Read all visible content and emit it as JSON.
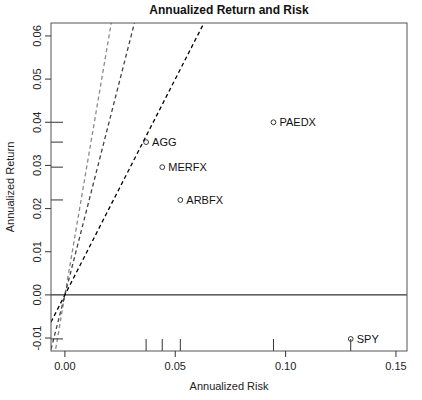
{
  "chart_data": {
    "type": "scatter",
    "title": "Annualized Return and Risk",
    "xlabel": "Annualized Risk",
    "ylabel": "Annualized Return",
    "xlim": [
      -0.0063,
      0.155
    ],
    "ylim": [
      -0.013,
      0.063
    ],
    "x_ticks": [
      0.0,
      0.05,
      0.1,
      0.15
    ],
    "x_tick_labels": [
      "0.00",
      "0.05",
      "0.10",
      "0.15"
    ],
    "y_ticks": [
      -0.01,
      0.0,
      0.01,
      0.02,
      0.03,
      0.04,
      0.05,
      0.06
    ],
    "y_tick_labels": [
      "-0.01",
      "0.00",
      "0.01",
      "0.02",
      "0.03",
      "0.04",
      "0.05",
      "0.06"
    ],
    "grid": false,
    "legend": null,
    "points": [
      {
        "label": "PAEDX",
        "risk": 0.0945,
        "return": 0.04
      },
      {
        "label": "AGG",
        "risk": 0.0368,
        "return": 0.0354
      },
      {
        "label": "MERFX",
        "risk": 0.0441,
        "return": 0.0296
      },
      {
        "label": "ARBFX",
        "risk": 0.0523,
        "return": 0.022
      },
      {
        "label": "SPY",
        "risk": 0.1295,
        "return": -0.0102
      }
    ],
    "reference_lines": [
      {
        "type": "horizontal",
        "y": 0.0,
        "style": "solid",
        "color": "#000000"
      },
      {
        "type": "ray_through_origin",
        "slope": 3.0,
        "style": "dashed",
        "color": "#8a8a8a"
      },
      {
        "type": "ray_through_origin",
        "slope": 2.0,
        "style": "dashed",
        "color": "#444444"
      },
      {
        "type": "ray_through_origin",
        "slope": 1.0,
        "style": "dashed",
        "color": "#000000"
      }
    ],
    "rug": {
      "x": true,
      "y": true
    }
  }
}
